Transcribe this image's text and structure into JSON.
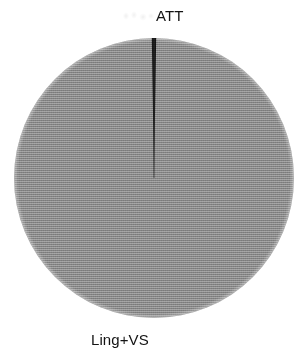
{
  "figure": {
    "background_color": "#ffffff",
    "width": 308,
    "height": 356
  },
  "chart_data": {
    "type": "pie",
    "title": "",
    "subtitle": "",
    "xlabel": "",
    "ylabel": "",
    "grid": false,
    "legend_position": "none",
    "label_placement": "outside",
    "start_angle_deg": 90,
    "direction": "clockwise",
    "center": {
      "x": 154,
      "y": 178
    },
    "radius": 140,
    "categories": [
      "ATT",
      "Ling+VS"
    ],
    "values": [
      0.5,
      99.5
    ],
    "labels": [
      "ATT",
      "Ling+VS"
    ],
    "colors": [
      "#141414",
      "#8a8a8a"
    ],
    "slices": [
      {
        "label": "ATT",
        "value": 0.5,
        "percent": 0.5,
        "color": "#141414",
        "angle_deg": 1.8,
        "label_position": "top"
      },
      {
        "label": "Ling+VS",
        "value": 99.5,
        "percent": 99.5,
        "color": "#8a8a8a",
        "angle_deg": 358.2,
        "label_position": "bottom-left"
      }
    ]
  },
  "labels": {
    "att": "ATT",
    "ling_vs": "Ling+VS"
  },
  "colors": {
    "background": "#ffffff",
    "major_slice": "#8a8a8a",
    "minor_slice": "#141414",
    "text": "#131313"
  }
}
